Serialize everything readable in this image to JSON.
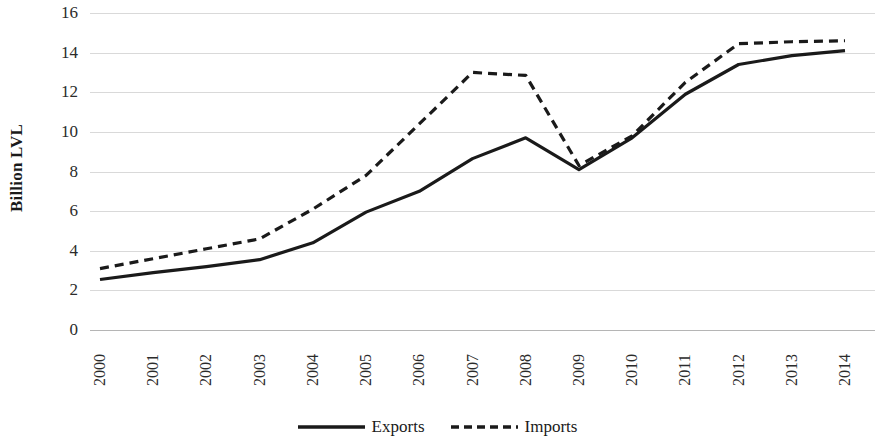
{
  "chart_data": {
    "type": "line",
    "title": "",
    "xlabel": "",
    "ylabel": "Billion LVL",
    "x": [
      "2000",
      "2001",
      "2002",
      "2003",
      "2004",
      "2005",
      "2006",
      "2007",
      "2008",
      "2009",
      "2010",
      "2011",
      "2012",
      "2013",
      "2014"
    ],
    "categories": [
      "2000",
      "2001",
      "2002",
      "2003",
      "2004",
      "2005",
      "2006",
      "2007",
      "2008",
      "2009",
      "2010",
      "2011",
      "2012",
      "2013",
      "2014"
    ],
    "ylim": [
      0,
      16
    ],
    "ytick_labels": [
      "16",
      "14",
      "12",
      "10",
      "8",
      "6",
      "4",
      "2",
      "0"
    ],
    "ytick_values": [
      16,
      14,
      12,
      10,
      8,
      6,
      4,
      2,
      0
    ],
    "ytick_step": 2,
    "grid": "horizontal",
    "legend_position": "bottom-center",
    "series": [
      {
        "name": "Exports",
        "style": "solid",
        "color": "#1a1a1a",
        "values": [
          2.55,
          2.9,
          3.2,
          3.55,
          4.4,
          5.95,
          7.0,
          8.65,
          9.7,
          8.1,
          9.7,
          11.9,
          13.4,
          13.85,
          14.1
        ]
      },
      {
        "name": "Imports",
        "style": "dashed",
        "color": "#1a1a1a",
        "values": [
          3.1,
          3.6,
          4.1,
          4.6,
          6.1,
          7.8,
          10.4,
          13.0,
          12.85,
          8.3,
          9.8,
          12.5,
          14.45,
          14.55,
          14.6
        ]
      }
    ]
  },
  "legend": {
    "entries": [
      {
        "label": "Exports",
        "style": "solid"
      },
      {
        "label": "Imports",
        "style": "dashed"
      }
    ]
  },
  "axes": {
    "y_title": "Billion LVL"
  },
  "colors": {
    "series_line": "#1a1a1a",
    "gridline": "#d9d9d9",
    "axis_line": "#b5b5b5",
    "background": "#ffffff",
    "text": "#1a1a1a"
  }
}
